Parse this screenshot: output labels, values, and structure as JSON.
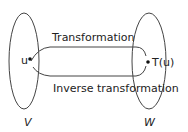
{
  "diagram": {
    "sets": [
      {
        "name": "V",
        "label": "V"
      },
      {
        "name": "W",
        "label": "W"
      }
    ],
    "points": [
      {
        "name": "u",
        "label": "u"
      },
      {
        "name": "T(u)",
        "label": "T(u)"
      }
    ],
    "arrows": [
      {
        "label": "Transformation",
        "from": "u",
        "to": "T(u)"
      },
      {
        "label": "Inverse transformation",
        "from": "T(u)",
        "to": "u"
      }
    ],
    "colors": {
      "stroke": "#333333",
      "background": "#ffffff"
    }
  }
}
